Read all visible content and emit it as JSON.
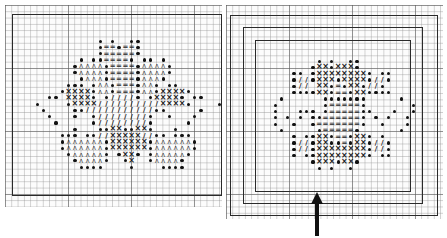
{
  "figure": {
    "grid": {
      "cell_px": 6.3,
      "major_every": 10,
      "minor_color": "#9a9a9a",
      "major_color": "#5a5a5a"
    },
    "legend_symbols": {
      "o": "dot-filled",
      ".": "dot-small",
      "x": "cross",
      "^": "caret",
      "=": "equals",
      "/": "slash"
    }
  },
  "left_chart": {
    "border_box": {
      "x": 12,
      "y": 14,
      "w": 210,
      "h": 182
    },
    "origin": {
      "x": 34,
      "y": 38
    },
    "rows": [
      "..........o.o..oo...........",
      "..........o==o==o...........",
      "..........o=====o...........",
      ".......o.oo====o.oo.o.......",
      "......o^^^^o====o^^^^o......",
      "......o^^^^o====o^^^^o......",
      ".......o^^^o====o^^^o.......",
      ".....ooo.o^^o===o^^o.oo.....",
      "....oxxxxo^^o===o^^oxxxxo...",
      "..oo.xxxxo.o////o.oxxxxo.oo.",
      "o....oxxxx//////////xxxxo....o",
      ".o....oo///////////oo.....o.",
      "..o...o..o////////o..o...o..",
      "...o.....o////////o.....o...",
      "......o...ooxxooxxo...o.....",
      "....ooo.oo//xxxxx//oo.ooo...",
      "....o^^^^^^oxxxxxxo^^^^^^o..",
      "....o^^^^^^oxxxxxxo^^^^^^o..",
      ".....o^^^^^o.oxxo.o^^^^^o...",
      "......o^^^^o..ox..o^^^^o....",
      ".......oooo....o....oooo...."
    ]
  },
  "right_chart": {
    "borders": [
      {
        "name": "outer",
        "x": 230,
        "y": 15,
        "w": 208,
        "h": 201
      },
      {
        "name": "middle",
        "x": 243,
        "y": 27,
        "w": 180,
        "h": 177
      },
      {
        "name": "inner",
        "x": 255,
        "y": 40,
        "w": 156,
        "h": 152
      }
    ],
    "origin": {
      "x": 272,
      "y": 58
    },
    "rows": [
      ".......o.o..oo........",
      "......oxxoxxxo........",
      "...oo.oxxxxxxxxo.oo...",
      "...o//oxxxoxxxxo//o...",
      "...o//.xxo=oxxo//o....",
      "...ooooxxo==oxxoooo...",
      ".o......ooooooo.....o.",
      "o.......o=====o.......o",
      "o...ooo.o=====oo...o..o",
      "o.o.o.oo======o.o.o..o",
      "o..o..o=======o..o...o",
      ".o.....o=====o......o.",
      "...o.ooxxo==oxxo.o....",
      "...o//oxxoo=oxxo//o...",
      "...o//oxxxxxxxxo//o...",
      "...o.ooxxxxxxxxo.oo...",
      "......oxxxoxxo........",
      ".......o.o..o........."
    ]
  },
  "annotation": {
    "arrow": {
      "x": 317,
      "tip_y": 192,
      "tail_y": 236,
      "direction": "up",
      "points_to": "inner border"
    }
  }
}
